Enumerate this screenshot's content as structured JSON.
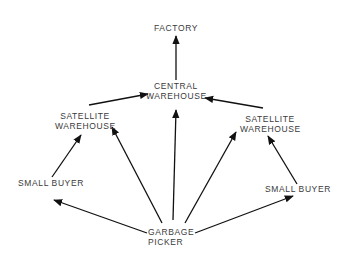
{
  "diagram": {
    "type": "flow",
    "colors": {
      "line": "#111111",
      "text": "#3a3a3a",
      "background": "#ffffff"
    },
    "nodes": [
      {
        "id": "factory",
        "label": "FACTORY"
      },
      {
        "id": "central",
        "line1": "CENTRAL",
        "line2": "WAREHOUSE"
      },
      {
        "id": "satL",
        "line1": "SATELLITE",
        "line2": "WAREHOUSE"
      },
      {
        "id": "satR",
        "line1": "SATELLITE",
        "line2": "WAREHOUSE"
      },
      {
        "id": "buyerL",
        "label": "SMALL BUYER"
      },
      {
        "id": "buyerR",
        "label": "SMALL BUYER"
      },
      {
        "id": "picker",
        "line1": "GARBAGE",
        "line2": "PICKER"
      }
    ],
    "edges": [
      {
        "from": "central",
        "to": "factory"
      },
      {
        "from": "satL",
        "to": "central"
      },
      {
        "from": "satR",
        "to": "central"
      },
      {
        "from": "buyerL",
        "to": "satL"
      },
      {
        "from": "buyerR",
        "to": "satR"
      },
      {
        "from": "picker",
        "to": "buyerL"
      },
      {
        "from": "picker",
        "to": "satL"
      },
      {
        "from": "picker",
        "to": "central"
      },
      {
        "from": "picker",
        "to": "satR"
      },
      {
        "from": "picker",
        "to": "buyerR"
      }
    ]
  }
}
